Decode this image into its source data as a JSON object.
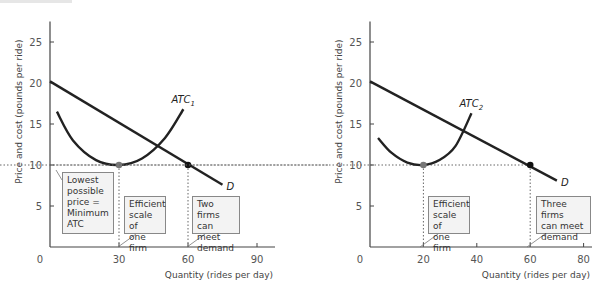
{
  "chart_data": [
    {
      "type": "line",
      "panel": "left",
      "ylabel": "Price and cost (pounds per ride)",
      "xlabel": "Quantity (rides per day)",
      "yticks": [
        5,
        10,
        15,
        20,
        25
      ],
      "xticks": [
        0,
        30,
        60,
        90
      ],
      "ylim": [
        0,
        27
      ],
      "xlim": [
        0,
        95
      ],
      "series": [
        {
          "name": "ATC_1",
          "label": "ATC",
          "sub": "1",
          "x": [
            3,
            10,
            20,
            30,
            40,
            50,
            58
          ],
          "y": [
            16.5,
            13,
            10.6,
            10,
            10.8,
            13.3,
            16.8
          ]
        },
        {
          "name": "D",
          "label": "D",
          "x": [
            0,
            75
          ],
          "y": [
            20.2,
            7.6
          ]
        }
      ],
      "points": [
        {
          "x": 30,
          "y": 10,
          "color": "#777777"
        },
        {
          "x": 60,
          "y": 10,
          "color": "#111111"
        }
      ],
      "annotations": [
        {
          "lines": [
            "Lowest",
            "possible",
            "price =",
            "Minimum",
            "ATC"
          ]
        },
        {
          "lines": [
            "Efficient",
            "scale of",
            "one firm"
          ]
        },
        {
          "lines": [
            "Two firms",
            "can meet",
            "demand"
          ]
        }
      ]
    },
    {
      "type": "line",
      "panel": "right",
      "ylabel": "Price and cost (pounds per ride)",
      "xlabel": "Quantity (rides per day)",
      "yticks": [
        5,
        10,
        15,
        20,
        25
      ],
      "xticks": [
        0,
        20,
        40,
        60,
        80
      ],
      "ylim": [
        0,
        27
      ],
      "xlim": [
        0,
        84
      ],
      "series": [
        {
          "name": "ATC_2",
          "label": "ATC",
          "sub": "2",
          "x": [
            3,
            8,
            14,
            20,
            26,
            32,
            38
          ],
          "y": [
            13.3,
            11.5,
            10.3,
            10,
            10.6,
            12.3,
            16.3
          ]
        },
        {
          "name": "D",
          "label": "D",
          "x": [
            0,
            70
          ],
          "y": [
            20.2,
            8.1
          ]
        }
      ],
      "points": [
        {
          "x": 20,
          "y": 10,
          "color": "#777777"
        },
        {
          "x": 60,
          "y": 10,
          "color": "#111111"
        }
      ],
      "annotations": [
        {
          "lines": [
            "Efficient",
            "scale of",
            "one firm"
          ]
        },
        {
          "lines": [
            "Three firms",
            "can meet",
            "demand"
          ]
        }
      ]
    }
  ]
}
